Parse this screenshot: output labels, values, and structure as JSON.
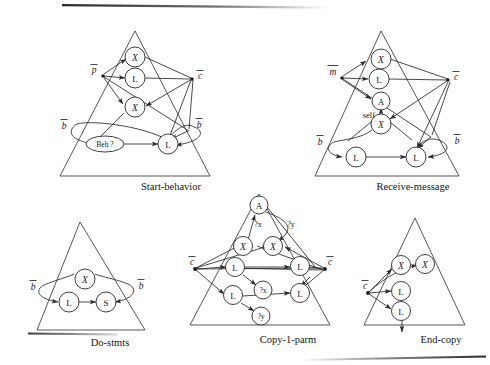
{
  "figure": {
    "background_color": "#ffffff",
    "ink_color": "#1a1a1a"
  },
  "rules": [
    {
      "id": "start-behavior",
      "caption": "Start-behavior",
      "ports": [
        {
          "name": "port-p-bar",
          "label": "p",
          "overbar": true,
          "side": "left"
        },
        {
          "name": "port-c-bar",
          "label": "c",
          "overbar": true,
          "side": "right"
        },
        {
          "name": "port-b-bar-left",
          "label": "b",
          "overbar": true,
          "side": "left"
        },
        {
          "name": "port-b-bar-right",
          "label": "b",
          "overbar": true,
          "side": "right"
        }
      ],
      "nodes": [
        {
          "name": "node-script-x-top",
          "label": "X",
          "shape": "circle",
          "style": "script"
        },
        {
          "name": "node-l-mid",
          "label": "L",
          "shape": "circle",
          "style": "roman"
        },
        {
          "name": "node-script-x-mid",
          "label": "X",
          "shape": "circle",
          "style": "script"
        },
        {
          "name": "node-beh-query",
          "label": "Beh ?",
          "shape": "ellipse",
          "style": "roman"
        },
        {
          "name": "node-l-bottom",
          "label": "L",
          "shape": "circle",
          "style": "roman"
        }
      ],
      "edge_labels": []
    },
    {
      "id": "receive-message",
      "caption": "Receive-message",
      "ports": [
        {
          "name": "port-m-bar",
          "label": "m",
          "overbar": true,
          "side": "left"
        },
        {
          "name": "port-c-bar",
          "label": "c",
          "overbar": true,
          "side": "right"
        },
        {
          "name": "port-b-bar-left",
          "label": "b",
          "overbar": true,
          "side": "left"
        },
        {
          "name": "port-b-bar-right",
          "label": "b",
          "overbar": true,
          "side": "right"
        }
      ],
      "nodes": [
        {
          "name": "node-script-x-top",
          "label": "X",
          "shape": "circle",
          "style": "script"
        },
        {
          "name": "node-l-upper",
          "label": "L",
          "shape": "circle",
          "style": "roman"
        },
        {
          "name": "node-a",
          "label": "A",
          "shape": "circle",
          "style": "roman"
        },
        {
          "name": "node-script-x-mid",
          "label": "X",
          "shape": "circle",
          "style": "script"
        },
        {
          "name": "node-l-bottom-left",
          "label": "L",
          "shape": "circle",
          "style": "roman"
        },
        {
          "name": "node-l-bottom-right",
          "label": "L",
          "shape": "circle",
          "style": "roman"
        }
      ],
      "edge_labels": [
        {
          "name": "edge-label-self",
          "label": "self"
        }
      ]
    },
    {
      "id": "do-stmts",
      "caption": "Do-stmts",
      "ports": [
        {
          "name": "port-b-bar-left",
          "label": "b",
          "overbar": true,
          "side": "left"
        },
        {
          "name": "port-b-bar-right",
          "label": "b",
          "overbar": true,
          "side": "right"
        }
      ],
      "nodes": [
        {
          "name": "node-script-x",
          "label": "X",
          "shape": "circle",
          "style": "script"
        },
        {
          "name": "node-l",
          "label": "L",
          "shape": "circle",
          "style": "roman"
        },
        {
          "name": "node-s",
          "label": "S",
          "shape": "circle",
          "style": "roman"
        }
      ],
      "edge_labels": []
    },
    {
      "id": "copy-1-parm",
      "caption": "Copy-1-parm",
      "ports": [
        {
          "name": "port-c-bar-left",
          "label": "c",
          "overbar": true,
          "side": "left"
        },
        {
          "name": "port-c-bar-right",
          "label": "c",
          "overbar": true,
          "side": "right"
        }
      ],
      "nodes": [
        {
          "name": "node-a",
          "label": "A",
          "shape": "circle",
          "style": "roman"
        },
        {
          "name": "node-script-x-left",
          "label": "X",
          "shape": "circle",
          "style": "script"
        },
        {
          "name": "node-script-x-right",
          "label": "X",
          "shape": "circle",
          "style": "script"
        },
        {
          "name": "node-l-upper-left",
          "label": "L",
          "shape": "circle",
          "style": "roman"
        },
        {
          "name": "node-l-upper-right",
          "label": "L",
          "shape": "circle",
          "style": "roman"
        },
        {
          "name": "node-query-x",
          "label": "?x",
          "shape": "circle",
          "style": "roman"
        },
        {
          "name": "node-l-lower-left",
          "label": "L",
          "shape": "circle",
          "style": "roman"
        },
        {
          "name": "node-l-lower-right",
          "label": "L",
          "shape": "circle",
          "style": "roman"
        },
        {
          "name": "node-query-y",
          "label": "?y",
          "shape": "circle",
          "style": "roman"
        }
      ],
      "edge_labels": [
        {
          "name": "edge-label-query-x",
          "label": "?x"
        },
        {
          "name": "edge-label-query-y",
          "label": "?y"
        }
      ]
    },
    {
      "id": "end-copy",
      "caption": "End-copy",
      "ports": [
        {
          "name": "port-c-bar",
          "label": "c",
          "overbar": true,
          "side": "left"
        }
      ],
      "nodes": [
        {
          "name": "node-script-x-left",
          "label": "X",
          "shape": "circle",
          "style": "script"
        },
        {
          "name": "node-script-x-right",
          "label": "X",
          "shape": "circle",
          "style": "script"
        },
        {
          "name": "node-l-upper",
          "label": "L",
          "shape": "circle",
          "style": "roman"
        },
        {
          "name": "node-l-lower",
          "label": "L",
          "shape": "circle",
          "style": "roman"
        }
      ],
      "edge_labels": []
    }
  ]
}
